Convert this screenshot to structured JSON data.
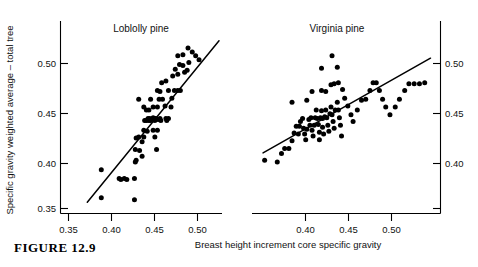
{
  "figure": {
    "caption": "FIGURE  12.9",
    "ylabel": "Specific gravity weighted average – total tree",
    "xlabel": "Breast height increment core specific gravity"
  },
  "chart_data": [
    {
      "type": "scatter",
      "title": "Loblolly pine",
      "panel": "left",
      "xlabel": "Breast height increment core specific gravity",
      "ylabel": "Specific gravity weighted average – total tree",
      "xlim": [
        0.332,
        0.522
      ],
      "ylim": [
        0.342,
        0.528
      ],
      "xticks": [
        0.35,
        0.4,
        0.45,
        0.5
      ],
      "xtick_labels": [
        "0.35",
        "0.40",
        "0.45",
        "0.50"
      ],
      "yticks": [
        0.35,
        0.4,
        0.45,
        0.5
      ],
      "ytick_labels": [
        "0.35",
        "0.40",
        "0.45",
        "0.50"
      ],
      "yaxis_side": "left",
      "grid": false,
      "legend": "none",
      "fit_line": {
        "x": [
          0.3635,
          0.5185
        ],
        "y": [
          0.3565,
          0.5235
        ]
      },
      "points": [
        [
          0.38,
          0.39
        ],
        [
          0.38,
          0.361
        ],
        [
          0.401,
          0.381
        ],
        [
          0.403,
          0.38
        ],
        [
          0.407,
          0.381
        ],
        [
          0.41,
          0.38
        ],
        [
          0.419,
          0.381
        ],
        [
          0.419,
          0.359
        ],
        [
          0.42,
          0.398
        ],
        [
          0.421,
          0.4
        ],
        [
          0.42,
          0.411
        ],
        [
          0.421,
          0.423
        ],
        [
          0.424,
          0.424
        ],
        [
          0.425,
          0.41
        ],
        [
          0.428,
          0.404
        ],
        [
          0.428,
          0.419
        ],
        [
          0.43,
          0.431
        ],
        [
          0.43,
          0.424
        ],
        [
          0.431,
          0.441
        ],
        [
          0.433,
          0.441
        ],
        [
          0.434,
          0.43
        ],
        [
          0.435,
          0.443
        ],
        [
          0.436,
          0.441
        ],
        [
          0.437,
          0.443
        ],
        [
          0.438,
          0.441
        ],
        [
          0.433,
          0.452
        ],
        [
          0.436,
          0.452
        ],
        [
          0.43,
          0.455
        ],
        [
          0.424,
          0.463
        ],
        [
          0.438,
          0.463
        ],
        [
          0.441,
          0.455
        ],
        [
          0.441,
          0.444
        ],
        [
          0.442,
          0.443
        ],
        [
          0.443,
          0.441
        ],
        [
          0.444,
          0.443
        ],
        [
          0.445,
          0.442
        ],
        [
          0.441,
          0.431
        ],
        [
          0.443,
          0.424
        ],
        [
          0.445,
          0.411
        ],
        [
          0.446,
          0.431
        ],
        [
          0.448,
          0.442
        ],
        [
          0.449,
          0.443
        ],
        [
          0.45,
          0.441
        ],
        [
          0.446,
          0.455
        ],
        [
          0.448,
          0.463
        ],
        [
          0.449,
          0.471
        ],
        [
          0.446,
          0.472
        ],
        [
          0.452,
          0.463
        ],
        [
          0.455,
          0.456
        ],
        [
          0.456,
          0.443
        ],
        [
          0.457,
          0.441
        ],
        [
          0.459,
          0.443
        ],
        [
          0.462,
          0.455
        ],
        [
          0.463,
          0.464
        ],
        [
          0.451,
          0.48
        ],
        [
          0.456,
          0.482
        ],
        [
          0.459,
          0.472
        ],
        [
          0.466,
          0.472
        ],
        [
          0.47,
          0.472
        ],
        [
          0.473,
          0.472
        ],
        [
          0.464,
          0.487
        ],
        [
          0.467,
          0.494
        ],
        [
          0.47,
          0.489
        ],
        [
          0.472,
          0.499
        ],
        [
          0.476,
          0.498
        ],
        [
          0.478,
          0.491
        ],
        [
          0.481,
          0.493
        ],
        [
          0.483,
          0.501
        ],
        [
          0.47,
          0.508
        ],
        [
          0.476,
          0.509
        ],
        [
          0.482,
          0.516
        ],
        [
          0.487,
          0.512
        ],
        [
          0.491,
          0.508
        ],
        [
          0.495,
          0.504
        ]
      ]
    },
    {
      "type": "scatter",
      "title": "Virginia pine",
      "panel": "right",
      "xlabel": "Breast height increment core specific gravity",
      "ylabel": "Specific gravity weighted average – total tree",
      "xlim": [
        0.366,
        0.545
      ],
      "ylim": [
        0.342,
        0.528
      ],
      "xticks": [
        0.4,
        0.45,
        0.5
      ],
      "xtick_labels": [
        "0.40",
        "0.45",
        "0.50"
      ],
      "yticks": [
        0.35,
        0.4,
        0.45,
        0.5
      ],
      "ytick_labels": [
        "0.35",
        "0.40",
        "0.45",
        "0.50"
      ],
      "yaxis_side": "right",
      "grid": false,
      "legend": "none",
      "fit_line": {
        "x": [
          0.3765,
          0.5355
        ],
        "y": [
          0.4075,
          0.5055
        ]
      },
      "points": [
        [
          0.394,
          0.407
        ],
        [
          0.397,
          0.412
        ],
        [
          0.401,
          0.412
        ],
        [
          0.404,
          0.42
        ],
        [
          0.406,
          0.428
        ],
        [
          0.408,
          0.435
        ],
        [
          0.41,
          0.427
        ],
        [
          0.411,
          0.435
        ],
        [
          0.412,
          0.44
        ],
        [
          0.414,
          0.443
        ],
        [
          0.415,
          0.433
        ],
        [
          0.416,
          0.427
        ],
        [
          0.417,
          0.421
        ],
        [
          0.418,
          0.432
        ],
        [
          0.42,
          0.442
        ],
        [
          0.421,
          0.436
        ],
        [
          0.422,
          0.444
        ],
        [
          0.423,
          0.431
        ],
        [
          0.424,
          0.425
        ],
        [
          0.425,
          0.436
        ],
        [
          0.426,
          0.444
        ],
        [
          0.427,
          0.452
        ],
        [
          0.428,
          0.443
        ],
        [
          0.429,
          0.437
        ],
        [
          0.43,
          0.429
        ],
        [
          0.43,
          0.421
        ],
        [
          0.431,
          0.444
        ],
        [
          0.432,
          0.451
        ],
        [
          0.433,
          0.443
        ],
        [
          0.433,
          0.434
        ],
        [
          0.434,
          0.427
        ],
        [
          0.435,
          0.445
        ],
        [
          0.436,
          0.452
        ],
        [
          0.437,
          0.444
        ],
        [
          0.438,
          0.436
        ],
        [
          0.439,
          0.43
        ],
        [
          0.44,
          0.448
        ],
        [
          0.441,
          0.455
        ],
        [
          0.442,
          0.447
        ],
        [
          0.443,
          0.44
        ],
        [
          0.444,
          0.433
        ],
        [
          0.445,
          0.452
        ],
        [
          0.447,
          0.46
        ],
        [
          0.448,
          0.452
        ],
        [
          0.449,
          0.444
        ],
        [
          0.45,
          0.436
        ],
        [
          0.451,
          0.425
        ],
        [
          0.404,
          0.46
        ],
        [
          0.418,
          0.462
        ],
        [
          0.423,
          0.471
        ],
        [
          0.432,
          0.472
        ],
        [
          0.436,
          0.471
        ],
        [
          0.441,
          0.478
        ],
        [
          0.444,
          0.479
        ],
        [
          0.448,
          0.48
        ],
        [
          0.452,
          0.473
        ],
        [
          0.454,
          0.464
        ],
        [
          0.457,
          0.456
        ],
        [
          0.46,
          0.447
        ],
        [
          0.462,
          0.44
        ],
        [
          0.466,
          0.452
        ],
        [
          0.47,
          0.462
        ],
        [
          0.474,
          0.463
        ],
        [
          0.478,
          0.472
        ],
        [
          0.481,
          0.48
        ],
        [
          0.484,
          0.48
        ],
        [
          0.487,
          0.472
        ],
        [
          0.49,
          0.463
        ],
        [
          0.493,
          0.455
        ],
        [
          0.497,
          0.447
        ],
        [
          0.502,
          0.455
        ],
        [
          0.506,
          0.463
        ],
        [
          0.511,
          0.472
        ],
        [
          0.515,
          0.479
        ],
        [
          0.52,
          0.479
        ],
        [
          0.525,
          0.479
        ],
        [
          0.53,
          0.48
        ],
        [
          0.432,
          0.495
        ],
        [
          0.447,
          0.496
        ],
        [
          0.442,
          0.508
        ],
        [
          0.378,
          0.4
        ],
        [
          0.39,
          0.398
        ]
      ]
    }
  ]
}
